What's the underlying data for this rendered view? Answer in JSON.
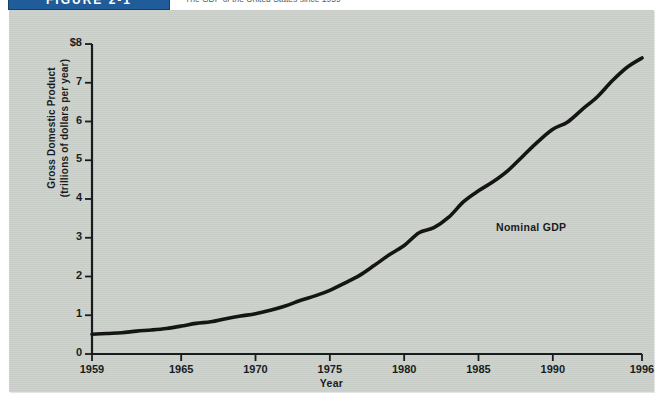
{
  "figure": {
    "banner_label": "FIGURE 2-1",
    "caption": "The GDP of the United States since 1959",
    "banner_color": "#1f5c99",
    "panel_color": "#ccd2cb",
    "line_color": "#111111"
  },
  "chart_data": {
    "type": "line",
    "title": "",
    "xlabel": "Year",
    "ylabel": "Gross Domestic Product (trillions of dollars per year)",
    "ylabel_line1": "Gross Domestic Product",
    "ylabel_line2": "(trillions of dollars per year)",
    "grid": false,
    "legend_position": "inline-annotation",
    "annotations": [
      {
        "text": "Nominal GDP",
        "x": 1987,
        "y": 3.35
      }
    ],
    "xlim": [
      1959,
      1996
    ],
    "ylim": [
      0,
      8
    ],
    "x_tick_labels": [
      "1959",
      "1965",
      "1970",
      "1975",
      "1980",
      "1985",
      "1990",
      "1996"
    ],
    "x_ticks": [
      1959,
      1965,
      1970,
      1975,
      1980,
      1985,
      1990,
      1996
    ],
    "y_tick_labels": [
      "0",
      "1",
      "2",
      "3",
      "4",
      "5",
      "6",
      "7",
      "$8"
    ],
    "y_ticks": [
      0,
      1,
      2,
      3,
      4,
      5,
      6,
      7,
      8
    ],
    "series": [
      {
        "name": "Nominal GDP",
        "color": "#111111",
        "x": [
          1959,
          1960,
          1961,
          1962,
          1963,
          1964,
          1965,
          1966,
          1967,
          1968,
          1969,
          1970,
          1971,
          1972,
          1973,
          1974,
          1975,
          1976,
          1977,
          1978,
          1979,
          1980,
          1981,
          1982,
          1983,
          1984,
          1985,
          1986,
          1987,
          1988,
          1989,
          1990,
          1991,
          1992,
          1993,
          1994,
          1995,
          1996
        ],
        "values": [
          0.51,
          0.53,
          0.55,
          0.59,
          0.62,
          0.66,
          0.72,
          0.79,
          0.83,
          0.91,
          0.98,
          1.04,
          1.13,
          1.24,
          1.38,
          1.5,
          1.64,
          1.83,
          2.03,
          2.29,
          2.56,
          2.8,
          3.13,
          3.26,
          3.53,
          3.93,
          4.21,
          4.45,
          4.74,
          5.11,
          5.48,
          5.8,
          5.99,
          6.32,
          6.64,
          7.05,
          7.4,
          7.64
        ]
      }
    ]
  }
}
